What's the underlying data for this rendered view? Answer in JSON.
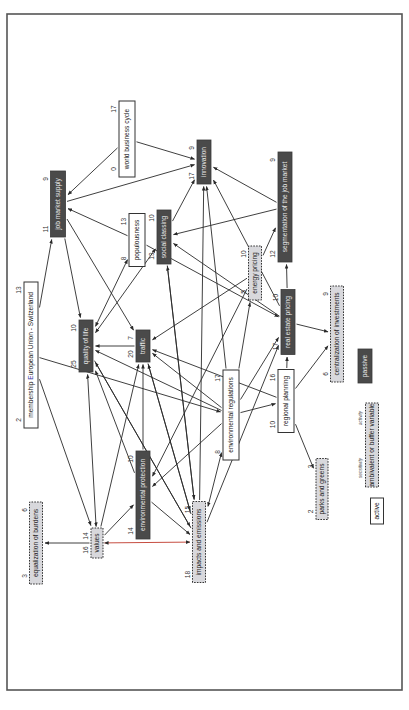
{
  "diagram": {
    "legend": {
      "passive": "passive",
      "ambivalent": "ambivalent or buffer variable",
      "active": "active",
      "sensitivity": "sensitivity",
      "activity": "activity"
    },
    "colors": {
      "passive_fill": "#4a4a4a",
      "ambivalent_fill": "#d8d8dc",
      "active_fill": "#ffffff",
      "accent_edge": "#c0392b",
      "eu_text": "#3a3aa8"
    },
    "nodes": [
      {
        "id": "wbc",
        "label": "world business cycle",
        "type": "active",
        "left": "0",
        "right": "17"
      },
      {
        "id": "inn",
        "label": "innovation",
        "type": "passive",
        "left": "17",
        "right": "9"
      },
      {
        "id": "jms",
        "label": "job market supply",
        "type": "passive",
        "left": "11",
        "right": "9"
      },
      {
        "id": "seg",
        "label": "segmentation of the job market",
        "type": "passive",
        "left": "12",
        "right": "9"
      },
      {
        "id": "pop",
        "label": "populousness",
        "type": "active",
        "left": "8",
        "right": "13"
      },
      {
        "id": "soc",
        "label": "social classing",
        "type": "passive",
        "left": "13",
        "right": "10"
      },
      {
        "id": "enp",
        "label": "energy pricing",
        "type": "ambivalent",
        "left": "5",
        "right": "10"
      },
      {
        "id": "qol",
        "label": "quality of life",
        "type": "passive",
        "left": "25",
        "right": "10"
      },
      {
        "id": "trf",
        "label": "traffic",
        "type": "passive",
        "left": "20",
        "right": "7"
      },
      {
        "id": "rep",
        "label": "real estate pricing",
        "type": "passive",
        "left": "17",
        "right": "10"
      },
      {
        "id": "cen",
        "label": "centralization of investments",
        "type": "ambivalent",
        "left": "6",
        "right": "9"
      },
      {
        "id": "eu",
        "label_pre": "membership ",
        "label_hl": "E",
        "label_post": "uropean Union - Switzerland",
        "label": "membership European Union - Switzerland",
        "type": "active",
        "left": "2",
        "right": "13"
      },
      {
        "id": "env",
        "label": "environmental regulations",
        "type": "active",
        "left": "8",
        "right": "17"
      },
      {
        "id": "reg",
        "label": "regional planning",
        "type": "active",
        "left": "10",
        "right": "16"
      },
      {
        "id": "epr",
        "label": "environmental protection",
        "type": "passive",
        "left": "14",
        "right": "10"
      },
      {
        "id": "val",
        "label": "values",
        "type": "ambivalent",
        "left": "16",
        "right": "14"
      },
      {
        "id": "eqb",
        "label": "equalization of burdens",
        "type": "ambivalent",
        "left": "3",
        "right": "6"
      },
      {
        "id": "imp",
        "label": "impacts and emissions",
        "type": "ambivalent",
        "left": "18",
        "right": "15"
      },
      {
        "id": "prk",
        "label": "parks and greens",
        "type": "ambivalent",
        "left": "2",
        "right": "3"
      }
    ],
    "edges": [
      {
        "from": "wbc",
        "to": "jms"
      },
      {
        "from": "wbc",
        "to": "inn"
      },
      {
        "from": "jms",
        "to": "inn"
      },
      {
        "from": "seg",
        "to": "inn"
      },
      {
        "from": "soc",
        "to": "inn"
      },
      {
        "from": "env",
        "to": "inn"
      },
      {
        "from": "rep",
        "to": "inn"
      },
      {
        "from": "imp",
        "to": "inn"
      },
      {
        "from": "pop",
        "to": "jms"
      },
      {
        "from": "seg",
        "to": "soc"
      },
      {
        "from": "enp",
        "to": "seg"
      },
      {
        "from": "rep",
        "to": "seg"
      },
      {
        "from": "jms",
        "to": "qol"
      },
      {
        "from": "jms",
        "to": "trf"
      },
      {
        "from": "eu",
        "to": "jms"
      },
      {
        "from": "pop",
        "to": "qol",
        "both": true
      },
      {
        "from": "soc",
        "to": "qol",
        "both": true
      },
      {
        "from": "pop",
        "to": "rep"
      },
      {
        "from": "rep",
        "to": "soc"
      },
      {
        "from": "enp",
        "to": "trf"
      },
      {
        "from": "enp",
        "to": "epr"
      },
      {
        "from": "trf",
        "to": "qol"
      },
      {
        "from": "rep",
        "to": "cen"
      },
      {
        "from": "env",
        "to": "trf"
      },
      {
        "from": "reg",
        "to": "trf"
      },
      {
        "from": "env",
        "to": "qol"
      },
      {
        "from": "env",
        "to": "rep"
      },
      {
        "from": "env",
        "to": "enp"
      },
      {
        "from": "env",
        "to": "reg"
      },
      {
        "from": "env",
        "to": "epr"
      },
      {
        "from": "env",
        "to": "imp",
        "both": true
      },
      {
        "from": "reg",
        "to": "rep"
      },
      {
        "from": "reg",
        "to": "cen"
      },
      {
        "from": "reg",
        "to": "prk"
      },
      {
        "from": "eu",
        "to": "env"
      },
      {
        "from": "eu",
        "to": "val"
      },
      {
        "from": "val",
        "to": "qol",
        "both": true
      },
      {
        "from": "val",
        "to": "trf"
      },
      {
        "from": "val",
        "to": "epr"
      },
      {
        "from": "val",
        "to": "eqb"
      },
      {
        "from": "val",
        "to": "imp",
        "both": true,
        "accent": true
      },
      {
        "from": "epr",
        "to": "imp"
      },
      {
        "from": "epr",
        "to": "qol"
      },
      {
        "from": "epr",
        "to": "trf"
      },
      {
        "from": "imp",
        "to": "qol"
      },
      {
        "from": "imp",
        "to": "trf"
      },
      {
        "from": "imp",
        "to": "soc"
      },
      {
        "from": "imp",
        "to": "rep"
      },
      {
        "from": "soc",
        "to": "imp"
      },
      {
        "from": "trf",
        "to": "imp"
      },
      {
        "from": "qol",
        "to": "imp"
      }
    ]
  }
}
